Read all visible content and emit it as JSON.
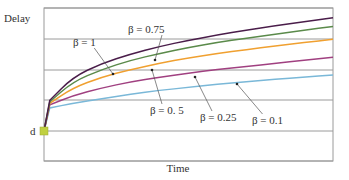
{
  "chart_data": {
    "type": "line",
    "title": "",
    "xlabel": "Time",
    "ylabel": "Delay",
    "y_origin_label": "d",
    "grid": {
      "horizontal": true,
      "vertical": false
    },
    "xlim": [
      0,
      1
    ],
    "ylim": [
      0,
      5
    ],
    "x": [
      0,
      0.02,
      0.1,
      0.2,
      0.3,
      0.4,
      0.5,
      0.6,
      0.7,
      0.8,
      0.9,
      1.0
    ],
    "series": [
      {
        "name": "β = 1",
        "color": "#4a1d4a",
        "values": [
          1.0,
          2.0,
          2.75,
          3.2,
          3.5,
          3.75,
          3.95,
          4.12,
          4.28,
          4.42,
          4.55,
          4.68
        ]
      },
      {
        "name": "β = 0.75",
        "color": "#5a8a4a",
        "values": [
          1.0,
          1.95,
          2.6,
          3.0,
          3.3,
          3.52,
          3.72,
          3.88,
          4.02,
          4.15,
          4.28,
          4.4
        ]
      },
      {
        "name": "β = 0.5",
        "color": "#f0a030",
        "values": [
          1.0,
          1.9,
          2.4,
          2.75,
          3.0,
          3.2,
          3.38,
          3.52,
          3.65,
          3.77,
          3.88,
          3.98
        ]
      },
      {
        "name": "β = 0.25",
        "color": "#a04080",
        "values": [
          1.0,
          1.85,
          2.15,
          2.4,
          2.6,
          2.75,
          2.88,
          3.0,
          3.1,
          3.2,
          3.3,
          3.4
        ]
      },
      {
        "name": "β = 0.1",
        "color": "#7ab8d8",
        "values": [
          1.0,
          1.75,
          1.9,
          2.05,
          2.2,
          2.32,
          2.42,
          2.52,
          2.6,
          2.68,
          2.75,
          2.82
        ]
      }
    ],
    "annotations": [
      {
        "text": "β = 1",
        "x": 73,
        "y": 46,
        "arrow_to": [
          113,
          74
        ]
      },
      {
        "text": "β = 0.75",
        "x": 128,
        "y": 33,
        "arrow_to": [
          155,
          60
        ]
      },
      {
        "text": "β = 0. 5",
        "x": 150,
        "y": 114,
        "arrow_to": [
          152,
          70
        ]
      },
      {
        "text": "β = 0.25",
        "x": 200,
        "y": 121,
        "arrow_to": [
          195,
          77
        ]
      },
      {
        "text": "β = 0.1",
        "x": 252,
        "y": 124,
        "arrow_to": [
          237,
          84
        ]
      }
    ],
    "marker": {
      "label": "d",
      "color": "#c0d040"
    }
  }
}
